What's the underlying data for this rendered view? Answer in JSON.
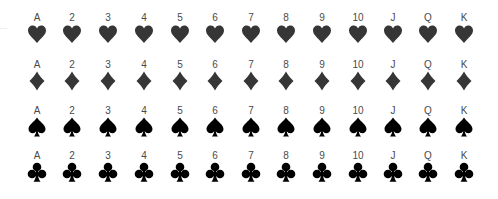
{
  "sheet": {
    "ranks": [
      "A",
      "2",
      "3",
      "4",
      "5",
      "6",
      "7",
      "8",
      "9",
      "10",
      "J",
      "Q",
      "K"
    ],
    "left_mark": "...",
    "rows": [
      {
        "suit": "hearts",
        "icon": "heart-icon",
        "color": "#363636"
      },
      {
        "suit": "diamonds",
        "icon": "diamond-icon",
        "color": "#363636"
      },
      {
        "suit": "spades",
        "icon": "spade-icon",
        "color": "#000000"
      },
      {
        "suit": "clubs",
        "icon": "club-icon",
        "color": "#000000"
      }
    ]
  }
}
